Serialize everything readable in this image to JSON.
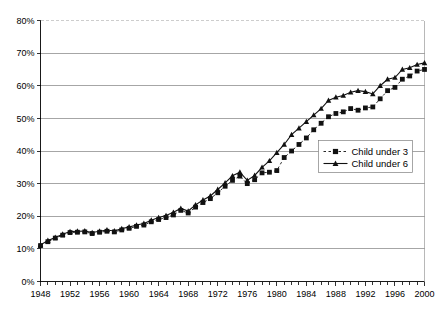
{
  "chart_data": {
    "type": "line",
    "title": "",
    "subtitle": "",
    "xlabel": "",
    "ylabel": "",
    "xlim": [
      1948,
      2000
    ],
    "ylim": [
      0,
      80
    ],
    "grid": true,
    "legend_position": "center-right",
    "x": [
      1948,
      1949,
      1950,
      1951,
      1952,
      1953,
      1954,
      1955,
      1956,
      1957,
      1958,
      1959,
      1960,
      1961,
      1962,
      1963,
      1964,
      1965,
      1966,
      1967,
      1968,
      1969,
      1970,
      1971,
      1972,
      1973,
      1974,
      1975,
      1976,
      1977,
      1978,
      1979,
      1980,
      1981,
      1982,
      1983,
      1984,
      1985,
      1986,
      1987,
      1988,
      1989,
      1990,
      1991,
      1992,
      1993,
      1994,
      1995,
      1996,
      1997,
      1998,
      1999,
      2000
    ],
    "xtick_labels": [
      "1948",
      "1952",
      "1956",
      "1960",
      "1964",
      "1968",
      "1972",
      "1976",
      "1980",
      "1984",
      "1988",
      "1992",
      "1996",
      "2000"
    ],
    "xtick_values": [
      1948,
      1952,
      1956,
      1960,
      1964,
      1968,
      1972,
      1976,
      1980,
      1984,
      1988,
      1992,
      1996,
      2000
    ],
    "ytick_labels": [
      "0%",
      "10%",
      "20%",
      "30%",
      "40%",
      "50%",
      "60%",
      "70%",
      "80%"
    ],
    "ytick_values": [
      0,
      10,
      20,
      30,
      40,
      50,
      60,
      70,
      80
    ],
    "series": [
      {
        "name": "Child under 3",
        "marker": "square",
        "line_style": "dashed",
        "color": "#111111",
        "values": [
          11.0,
          12.2,
          13.3,
          14.2,
          15.0,
          15.1,
          15.2,
          14.7,
          15.1,
          15.4,
          15.2,
          15.8,
          16.3,
          16.9,
          17.3,
          18.3,
          19.0,
          19.6,
          20.4,
          21.8,
          21.0,
          22.8,
          24.2,
          25.4,
          27.2,
          29.2,
          31.0,
          32.3,
          30.0,
          31.2,
          33.3,
          33.5,
          34.0,
          38.0,
          40.0,
          42.0,
          44.0,
          46.5,
          48.5,
          50.5,
          51.5,
          52.0,
          53.0,
          52.5,
          53.2,
          53.5,
          56.0,
          58.5,
          59.5,
          62.0,
          63.0,
          64.5,
          65.0
        ]
      },
      {
        "name": "Child under 6",
        "marker": "triangle",
        "line_style": "solid",
        "color": "#111111",
        "values": [
          11.2,
          12.6,
          13.5,
          14.5,
          15.3,
          15.4,
          15.5,
          15.0,
          15.4,
          15.8,
          15.5,
          16.2,
          16.7,
          17.3,
          17.8,
          18.8,
          19.6,
          20.2,
          21.2,
          22.4,
          21.6,
          23.5,
          25.0,
          26.2,
          28.2,
          30.2,
          32.4,
          33.5,
          31.0,
          32.5,
          35.0,
          37.0,
          39.5,
          42.0,
          45.0,
          47.0,
          49.0,
          51.0,
          53.0,
          55.5,
          56.5,
          57.0,
          58.0,
          58.5,
          58.2,
          57.5,
          60.0,
          62.0,
          62.5,
          65.0,
          65.5,
          66.5,
          67.0
        ]
      }
    ]
  },
  "legend": {
    "items": [
      {
        "label": "Child under 3"
      },
      {
        "label": "Child under 6"
      }
    ]
  },
  "axes": {
    "y_axis_name": "percent-axis",
    "x_axis_name": "year-axis"
  }
}
